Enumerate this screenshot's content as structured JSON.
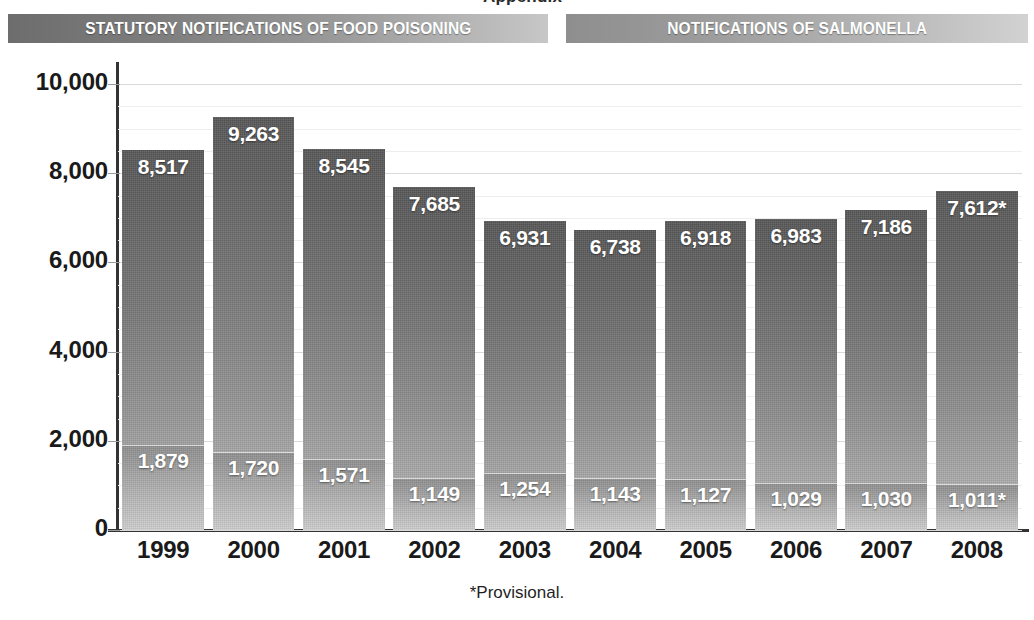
{
  "page": {
    "clipped_title_fragment": "Appendix"
  },
  "legend": {
    "items": [
      {
        "label": "STATUTORY NOTIFICATIONS OF FOOD POISONING",
        "name": "legend-food-poisoning",
        "color_start": "#6d6d6d",
        "color_end": "#c7c7c7"
      },
      {
        "label": "NOTIFICATIONS OF SALMONELLA",
        "name": "legend-salmonella",
        "color_start": "#8e8e8e",
        "color_end": "#d2d2d2"
      }
    ]
  },
  "axis": {
    "y_tick_labels": [
      "10,000",
      "8,000",
      "6,000",
      "4,000",
      "2,000",
      "0"
    ],
    "y_tick_values": [
      10000,
      8000,
      6000,
      4000,
      2000,
      0
    ],
    "minor_step": 500
  },
  "footnote": "*Provisional.",
  "chart_data": {
    "type": "bar",
    "title": "",
    "subtitle": "",
    "xlabel": "",
    "ylabel": "",
    "ylim": [
      0,
      10000
    ],
    "ytick_step": 2000,
    "minor_gridline_step": 500,
    "grid": true,
    "stacked": true,
    "legend_position": "top",
    "categories": [
      "1999",
      "2000",
      "2001",
      "2002",
      "2003",
      "2004",
      "2005",
      "2006",
      "2007",
      "2008"
    ],
    "series": [
      {
        "name": "STATUTORY NOTIFICATIONS OF FOOD POISONING",
        "values": [
          8517,
          9263,
          8545,
          7685,
          6931,
          6738,
          6918,
          6983,
          7186,
          7612
        ],
        "labels": [
          "8,517",
          "9,263",
          "8,545",
          "7,685",
          "6,931",
          "6,738",
          "6,918",
          "6,983",
          "7,186",
          "7,612*"
        ]
      },
      {
        "name": "NOTIFICATIONS OF SALMONELLA",
        "values": [
          1879,
          1720,
          1571,
          1149,
          1254,
          1143,
          1127,
          1029,
          1030,
          1011
        ],
        "labels": [
          "1,879",
          "1,720",
          "1,571",
          "1,149",
          "1,254",
          "1,143",
          "1,127",
          "1,029",
          "1,030",
          "1,011*"
        ]
      }
    ],
    "annotations": [
      "*Provisional."
    ]
  }
}
